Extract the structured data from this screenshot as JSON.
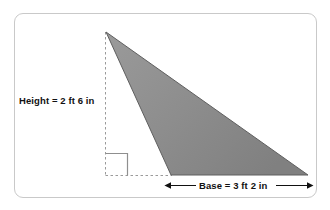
{
  "figure": {
    "shape_name": "triangle",
    "fill_color": "#8a8a8a",
    "outline_color": "#5f5f5f",
    "guide_color": "#9a9a9a",
    "card_border_color": "#c9c9c9",
    "background_color": "#ffffff",
    "text_color": "#111111",
    "height_label": "Height = 2 ft 6 in",
    "base_label": "Base = 3 ft 2 in",
    "right_angle_marker": "right-angle",
    "vertices": {
      "apex": [
        106,
        32
      ],
      "bottom_left": [
        171,
        175
      ],
      "bottom_right": [
        308,
        175
      ]
    },
    "dimensions": {
      "height_value": "2 ft 6 in",
      "base_value": "3 ft 2 in"
    }
  }
}
